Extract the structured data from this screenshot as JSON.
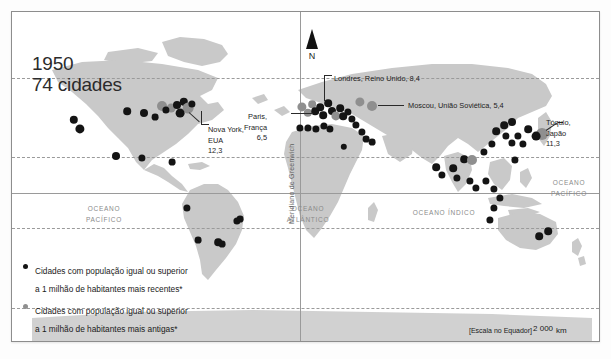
{
  "figure": {
    "title": {
      "year": "1950",
      "cities": "74 cidades"
    },
    "north_arrow_label": "N",
    "meridian_label": "Meridiano de Greenwich"
  },
  "ocean_labels": [
    {
      "name": "ocean-label-pacifico-oeste",
      "text": "OCEANO\nPACÍFICO",
      "x": 92,
      "y": 192
    },
    {
      "name": "ocean-label-atlantico",
      "text": "OCEANO\nATLÂNTICO",
      "x": 296,
      "y": 192
    },
    {
      "name": "ocean-label-indico",
      "text": "OCEANO ÍNDICO",
      "x": 432,
      "y": 196
    },
    {
      "name": "ocean-label-pacifico-leste",
      "text": "OCEANO\nPACÍFICO",
      "x": 557,
      "y": 166
    }
  ],
  "callouts": [
    {
      "name": "callout-nova-york",
      "text": "Nova York,\nEUA\n12,3",
      "x": 196,
      "y": 113
    },
    {
      "name": "callout-paris",
      "text": "Paris,\nFrança\n6,5",
      "x": 255,
      "y": 100
    },
    {
      "name": "callout-londres",
      "text": "Londres, Reino Unido, 8,4",
      "x": 322,
      "y": 62
    },
    {
      "name": "callout-moscou",
      "text": "Moscou, União Soviética, 5,4",
      "x": 396,
      "y": 89
    },
    {
      "name": "callout-toquio",
      "text": "Tóquio,\nJapão\n11,3",
      "x": 534,
      "y": 106
    }
  ],
  "legend": {
    "items": [
      {
        "symbol": "recent",
        "text": "Cidades com população igual ou superior\na 1 milhão de habitantes mais recentes*"
      },
      {
        "symbol": "antiga",
        "text": "Cidades com população igual ou superior\na 1 milhão de habitantes mais antigas*"
      }
    ],
    "note": "*Em relação ao ano representado"
  },
  "scale": {
    "equator_note": "[Escala no Equador]",
    "value": "2 000",
    "unit": "km"
  },
  "chart_data": {
    "type": "scatter",
    "projection": "world map (equirectangular)",
    "grid": true,
    "legend_position": "bottom-left",
    "series": [
      {
        "name": "Cidades com população igual ou superior a 1 milhão de habitantes mais recentes*",
        "color": "#141414"
      },
      {
        "name": "Cidades com população igual ou superior a 1 milhão de habitantes mais antigas*",
        "color": "#8f8f8f"
      }
    ],
    "annotated_cities": [
      {
        "city": "Nova York",
        "country": "EUA",
        "population_millions": 12.3
      },
      {
        "city": "Paris",
        "country": "França",
        "population_millions": 6.5
      },
      {
        "city": "Londres",
        "country": "Reino Unido",
        "population_millions": 8.4
      },
      {
        "city": "Moscou",
        "country": "União Soviética",
        "population_millions": 5.4
      },
      {
        "city": "Tóquio",
        "country": "Japão",
        "population_millions": 11.3
      }
    ],
    "points": [
      {
        "s": "recent",
        "x": 62,
        "y": 108,
        "r": 4.2
      },
      {
        "s": "recent",
        "x": 68,
        "y": 117,
        "r": 4.6
      },
      {
        "s": "recent",
        "x": 104,
        "y": 144,
        "r": 4.0
      },
      {
        "s": "recent",
        "x": 115,
        "y": 99,
        "r": 3.8
      },
      {
        "s": "antiga",
        "x": 150,
        "y": 94,
        "r": 5.0
      },
      {
        "s": "antiga",
        "x": 159,
        "y": 96,
        "r": 4.4
      },
      {
        "s": "recent",
        "x": 154,
        "y": 98,
        "r": 3.6
      },
      {
        "s": "recent",
        "x": 165,
        "y": 93,
        "r": 4.0
      },
      {
        "s": "recent",
        "x": 172,
        "y": 90,
        "r": 4.2
      },
      {
        "s": "antiga",
        "x": 176,
        "y": 96,
        "r": 5.4
      },
      {
        "s": "recent",
        "x": 168,
        "y": 101,
        "r": 4.4
      },
      {
        "s": "recent",
        "x": 180,
        "y": 92,
        "r": 3.6
      },
      {
        "s": "recent",
        "x": 132,
        "y": 101,
        "r": 4.0
      },
      {
        "s": "recent",
        "x": 143,
        "y": 105,
        "r": 3.4
      },
      {
        "s": "recent",
        "x": 130,
        "y": 146,
        "r": 3.6
      },
      {
        "s": "recent",
        "x": 160,
        "y": 150,
        "r": 3.4
      },
      {
        "s": "recent",
        "x": 175,
        "y": 196,
        "r": 3.6
      },
      {
        "s": "recent",
        "x": 225,
        "y": 209,
        "r": 3.6
      },
      {
        "s": "recent",
        "x": 228,
        "y": 207,
        "r": 3.4
      },
      {
        "s": "recent",
        "x": 206,
        "y": 230,
        "r": 3.8
      },
      {
        "s": "recent",
        "x": 210,
        "y": 232,
        "r": 3.4
      },
      {
        "s": "recent",
        "x": 186,
        "y": 228,
        "r": 3.4
      },
      {
        "s": "antiga",
        "x": 290,
        "y": 95,
        "r": 4.6
      },
      {
        "s": "antiga",
        "x": 296,
        "y": 101,
        "r": 4.2
      },
      {
        "s": "antiga",
        "x": 300,
        "y": 92,
        "r": 3.8
      },
      {
        "s": "recent",
        "x": 303,
        "y": 99,
        "r": 3.8
      },
      {
        "s": "recent",
        "x": 308,
        "y": 95,
        "r": 3.8
      },
      {
        "s": "recent",
        "x": 311,
        "y": 103,
        "r": 3.8
      },
      {
        "s": "recent",
        "x": 316,
        "y": 91,
        "r": 3.8
      },
      {
        "s": "recent",
        "x": 320,
        "y": 99,
        "r": 4.0
      },
      {
        "s": "antiga",
        "x": 324,
        "y": 104,
        "r": 4.6
      },
      {
        "s": "recent",
        "x": 328,
        "y": 96,
        "r": 3.8
      },
      {
        "s": "recent",
        "x": 331,
        "y": 104,
        "r": 3.8
      },
      {
        "s": "recent",
        "x": 336,
        "y": 100,
        "r": 3.6
      },
      {
        "s": "recent",
        "x": 340,
        "y": 107,
        "r": 3.6
      },
      {
        "s": "recent",
        "x": 344,
        "y": 113,
        "r": 3.6
      },
      {
        "s": "recent",
        "x": 288,
        "y": 116,
        "r": 3.6
      },
      {
        "s": "recent",
        "x": 296,
        "y": 116,
        "r": 3.6
      },
      {
        "s": "recent",
        "x": 304,
        "y": 117,
        "r": 3.6
      },
      {
        "s": "recent",
        "x": 312,
        "y": 114,
        "r": 3.6
      },
      {
        "s": "recent",
        "x": 318,
        "y": 117,
        "r": 3.6
      },
      {
        "s": "recent",
        "x": 350,
        "y": 120,
        "r": 3.6
      },
      {
        "s": "antiga",
        "x": 348,
        "y": 90,
        "r": 4.6
      },
      {
        "s": "antiga",
        "x": 360,
        "y": 94,
        "r": 5.0
      },
      {
        "s": "recent",
        "x": 354,
        "y": 127,
        "r": 3.4
      },
      {
        "s": "recent",
        "x": 332,
        "y": 135,
        "r": 3.2
      },
      {
        "s": "recent",
        "x": 424,
        "y": 155,
        "r": 3.8
      },
      {
        "s": "recent",
        "x": 430,
        "y": 163,
        "r": 3.6
      },
      {
        "s": "recent",
        "x": 441,
        "y": 156,
        "r": 3.8
      },
      {
        "s": "recent",
        "x": 445,
        "y": 166,
        "r": 3.6
      },
      {
        "s": "recent",
        "x": 452,
        "y": 147,
        "r": 3.8
      },
      {
        "s": "antiga",
        "x": 460,
        "y": 148,
        "r": 5.0
      },
      {
        "s": "recent",
        "x": 458,
        "y": 169,
        "r": 3.6
      },
      {
        "s": "recent",
        "x": 464,
        "y": 176,
        "r": 3.6
      },
      {
        "s": "recent",
        "x": 474,
        "y": 169,
        "r": 3.6
      },
      {
        "s": "recent",
        "x": 482,
        "y": 177,
        "r": 3.6
      },
      {
        "s": "recent",
        "x": 488,
        "y": 186,
        "r": 3.6
      },
      {
        "s": "recent",
        "x": 482,
        "y": 196,
        "r": 3.6
      },
      {
        "s": "recent",
        "x": 478,
        "y": 208,
        "r": 3.6
      },
      {
        "s": "recent",
        "x": 472,
        "y": 140,
        "r": 3.6
      },
      {
        "s": "recent",
        "x": 480,
        "y": 132,
        "r": 3.6
      },
      {
        "s": "recent",
        "x": 484,
        "y": 119,
        "r": 3.8
      },
      {
        "s": "recent",
        "x": 492,
        "y": 113,
        "r": 3.8
      },
      {
        "s": "recent",
        "x": 500,
        "y": 110,
        "r": 4.0
      },
      {
        "s": "recent",
        "x": 494,
        "y": 124,
        "r": 3.6
      },
      {
        "s": "recent",
        "x": 500,
        "y": 131,
        "r": 3.6
      },
      {
        "s": "recent",
        "x": 506,
        "y": 124,
        "r": 3.6
      },
      {
        "s": "recent",
        "x": 511,
        "y": 132,
        "r": 3.6
      },
      {
        "s": "recent",
        "x": 516,
        "y": 117,
        "r": 3.8
      },
      {
        "s": "recent",
        "x": 503,
        "y": 148,
        "r": 3.6
      },
      {
        "s": "antiga",
        "x": 530,
        "y": 122,
        "r": 6.0
      },
      {
        "s": "recent",
        "x": 524,
        "y": 124,
        "r": 4.4
      },
      {
        "s": "recent",
        "x": 527,
        "y": 224,
        "r": 3.8
      },
      {
        "s": "recent",
        "x": 536,
        "y": 219,
        "r": 3.8
      },
      {
        "s": "recent",
        "x": 360,
        "y": 130,
        "r": 3.4
      }
    ]
  }
}
